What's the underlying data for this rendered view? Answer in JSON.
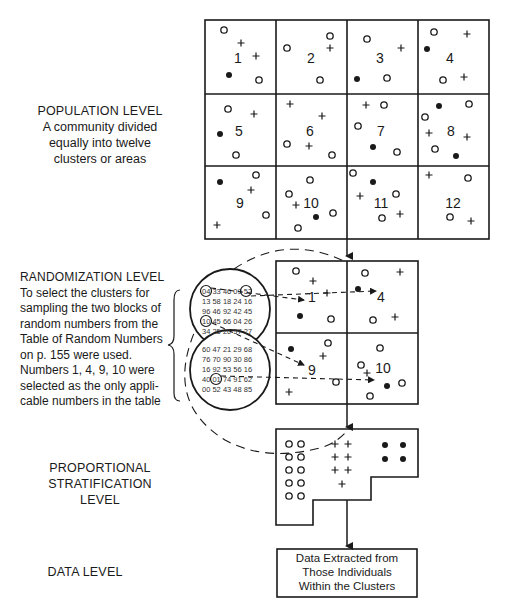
{
  "levels": {
    "population": {
      "title": "POPULATION LEVEL",
      "lines": [
        "A community divided",
        "equally into twelve",
        "clusters or areas"
      ]
    },
    "randomization": {
      "title": "RANDOMIZATION LEVEL",
      "lines": [
        "To select the clusters for",
        "sampling the two blocks of",
        "random numbers from the",
        "Table of Random Numbers",
        "on p. 155 were used.",
        "Numbers 1, 4, 9, 10 were",
        "selected as the only appli-",
        "cable numbers in the table"
      ]
    },
    "stratification": {
      "lines": [
        "PROPORTIONAL",
        "STRATIFICATION",
        "LEVEL"
      ]
    },
    "data": {
      "title": "DATA LEVEL"
    }
  },
  "population_grid": {
    "clusters": [
      "1",
      "2",
      "3",
      "4",
      "5",
      "6",
      "7",
      "8",
      "9",
      "10",
      "11",
      "12"
    ]
  },
  "random_numbers": {
    "block1": [
      [
        "04",
        "33",
        "46",
        "09",
        "52"
      ],
      [
        "13",
        "58",
        "18",
        "24",
        "16"
      ],
      [
        "96",
        "46",
        "92",
        "42",
        "45"
      ],
      [
        "10",
        "45",
        "66",
        "04",
        "26"
      ],
      [
        "34",
        "25",
        "20",
        "57",
        "27"
      ]
    ],
    "block2": [
      [
        "60",
        "47",
        "21",
        "29",
        "68"
      ],
      [
        "76",
        "70",
        "90",
        "30",
        "86"
      ],
      [
        "16",
        "92",
        "53",
        "56",
        "16"
      ],
      [
        "40",
        "01",
        "74",
        "91",
        "62"
      ],
      [
        "00",
        "52",
        "43",
        "48",
        "85"
      ]
    ],
    "circled": [
      "04",
      "09",
      "10",
      "01"
    ]
  },
  "selected_grid": {
    "clusters": [
      "1",
      "4",
      "9",
      "10"
    ]
  },
  "stratification_legend": {
    "open_circle": "o",
    "plus": "+",
    "filled_dot": "●"
  },
  "data_box": {
    "lines": [
      "Data Extracted from",
      "Those Individuals",
      "Within the Clusters"
    ]
  }
}
